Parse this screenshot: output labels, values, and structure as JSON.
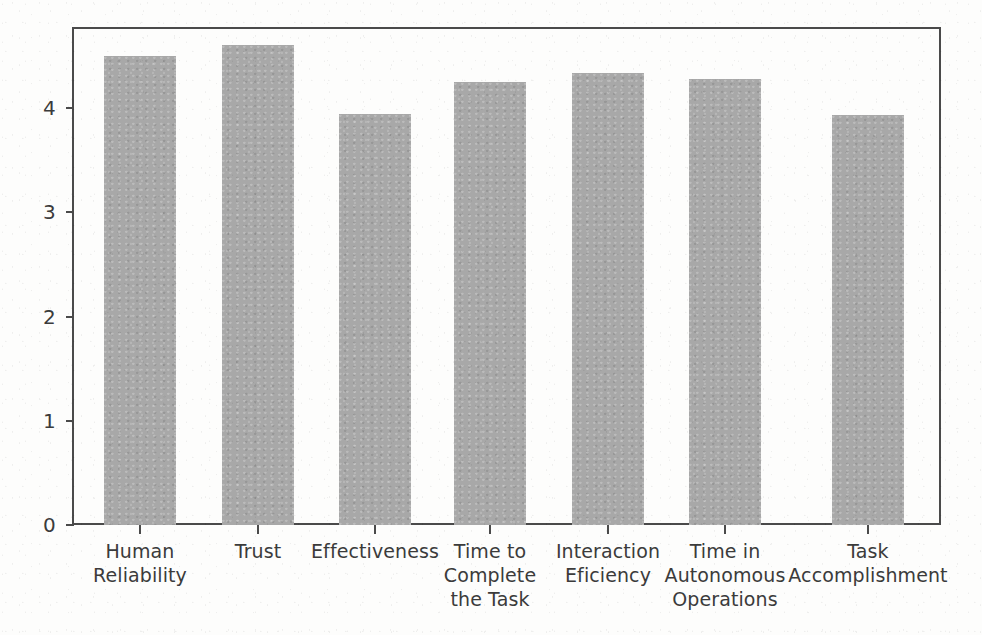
{
  "chart_data": {
    "type": "bar",
    "title": "",
    "subtitle": "",
    "xlabel": "",
    "ylabel": "",
    "categories": [
      "Human\nReliability",
      "Trust",
      "Effectiveness",
      "Time to\nComplete\nthe Task",
      "Interaction\nEficiency",
      "Time in\nAutonomous\nOperations",
      "Task\nAccomplishment"
    ],
    "values": [
      4.5,
      4.6,
      3.94,
      4.25,
      4.34,
      4.28,
      3.93
    ],
    "ylim": [
      0,
      4.78
    ],
    "ytick_labels": [
      "0",
      "1",
      "2",
      "3",
      "4"
    ],
    "ytick_values": [
      0,
      1,
      2,
      3,
      4
    ],
    "grid": false,
    "legend": null,
    "legend_position": "none",
    "bar_color": "#a8a8a8",
    "axis_color": "#4a4a4a",
    "text_color": "#3b3b3b",
    "background_color": "#fdfdfc"
  },
  "axis": {
    "y_ticks": [
      {
        "label": "0",
        "value": 0
      },
      {
        "label": "1",
        "value": 1
      },
      {
        "label": "2",
        "value": 2
      },
      {
        "label": "3",
        "value": 3
      },
      {
        "label": "4",
        "value": 4
      }
    ],
    "x_ticks": [
      {
        "label": "Human Reliability",
        "lines": [
          "Human",
          "Reliability"
        ]
      },
      {
        "label": "Trust",
        "lines": [
          "Trust"
        ]
      },
      {
        "label": "Effectiveness",
        "lines": [
          "Effectiveness"
        ]
      },
      {
        "label": "Time to Complete the Task",
        "lines": [
          "Time to",
          "Complete",
          "the Task"
        ]
      },
      {
        "label": "Interaction Eficiency",
        "lines": [
          "Interaction",
          "Eficiency"
        ]
      },
      {
        "label": "Time in Autonomous Operations",
        "lines": [
          "Time in",
          "Autonomous",
          "Operations"
        ]
      },
      {
        "label": "Task Accomplishment",
        "lines": [
          "Task",
          "Accomplishment"
        ]
      }
    ]
  }
}
